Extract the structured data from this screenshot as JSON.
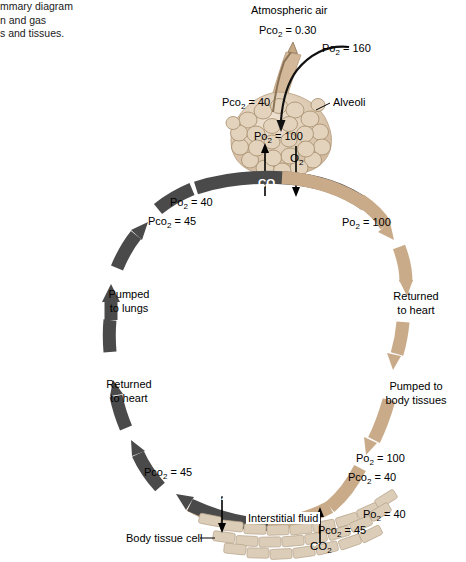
{
  "figure": {
    "caption": "mmary diagram\nn and gas\ns and tissues.",
    "background_color": "#ffffff",
    "oxygenated_color": "#c9ab89",
    "deoxygenated_color": "#4a4a4a",
    "tissue_color": "#dccdb8"
  },
  "atmosphere": {
    "title": "Atmospheric air",
    "pco2_label": "Pco",
    "pco2_sub": "2",
    "pco2_eq": "= 0.30",
    "po2_label": "Po",
    "po2_sub": "2",
    "po2_eq": "= 160"
  },
  "alveoli": {
    "name": "Alveoli",
    "pco2_label": "Pco",
    "pco2_sub": "2",
    "pco2_eq": "= 40",
    "po2_label": "Po",
    "po2_sub": "2",
    "po2_eq": "= 100",
    "o2_gas": "O",
    "o2_sub": "2",
    "co2_gas": "CO",
    "co2_sub": "2"
  },
  "pulmonary_in": {
    "po2_label": "Po",
    "po2_sub": "2",
    "po2_eq": "= 40",
    "pco2_label": "Pco",
    "pco2_sub": "2",
    "pco2_eq": "= 45"
  },
  "pulmonary_out": {
    "po2_label": "Po",
    "po2_sub": "2",
    "po2_eq": "= 100"
  },
  "flow": {
    "right_returned": "Returned\nto heart",
    "right_pumped": "Pumped to\nbody tissues",
    "left_pumped": "Pumped\nto lungs",
    "left_returned": "Returned\nto heart"
  },
  "systemic_arterial": {
    "po2_label": "Po",
    "po2_sub": "2",
    "po2_eq": "= 100",
    "pco2_label": "Pco",
    "pco2_sub": "2",
    "pco2_eq": "= 40"
  },
  "systemic_venous_right": {
    "po2_label": "Po",
    "po2_sub": "2",
    "po2_eq": "= 40",
    "pco2_label": "Pco",
    "pco2_sub": "2",
    "pco2_eq": "= 45"
  },
  "systemic_venous_left": {
    "pco2_label": "Pco",
    "pco2_sub": "2",
    "pco2_eq": "= 45"
  },
  "tissue": {
    "interstitial_fluid": "Interstitial fluid",
    "body_tissue_cell": "Body tissue cell",
    "o2_gas": "O",
    "o2_sub": "2",
    "co2_gas": "CO",
    "co2_sub": "2"
  }
}
